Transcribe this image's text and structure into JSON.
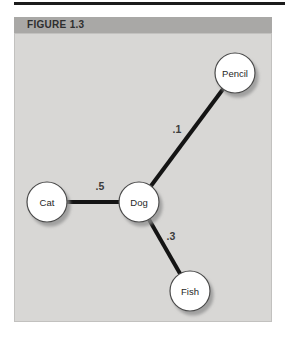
{
  "figure": {
    "title": "FIGURE 1.3"
  },
  "graph": {
    "type": "network",
    "nodes": [
      {
        "id": "pencil",
        "label": "Pencil"
      },
      {
        "id": "cat",
        "label": "Cat"
      },
      {
        "id": "dog",
        "label": "Dog"
      },
      {
        "id": "fish",
        "label": "Fish"
      }
    ],
    "edges": [
      {
        "from": "Dog",
        "to": "Pencil",
        "weight": ".1"
      },
      {
        "from": "Cat",
        "to": "Dog",
        "weight": ".5"
      },
      {
        "from": "Dog",
        "to": "Fish",
        "weight": ".3"
      }
    ]
  },
  "colors": {
    "top_rule": "#1b1b1b",
    "header_band": "#a9a8a6",
    "panel_background": "#d8d7d5",
    "edge": "#141414",
    "node_fill": "#ffffff",
    "node_border": "#4a4a4a",
    "node_shadow": "#8f8f8f",
    "title_text": "#2e2e2e",
    "label_text": "#3c3c3c"
  }
}
